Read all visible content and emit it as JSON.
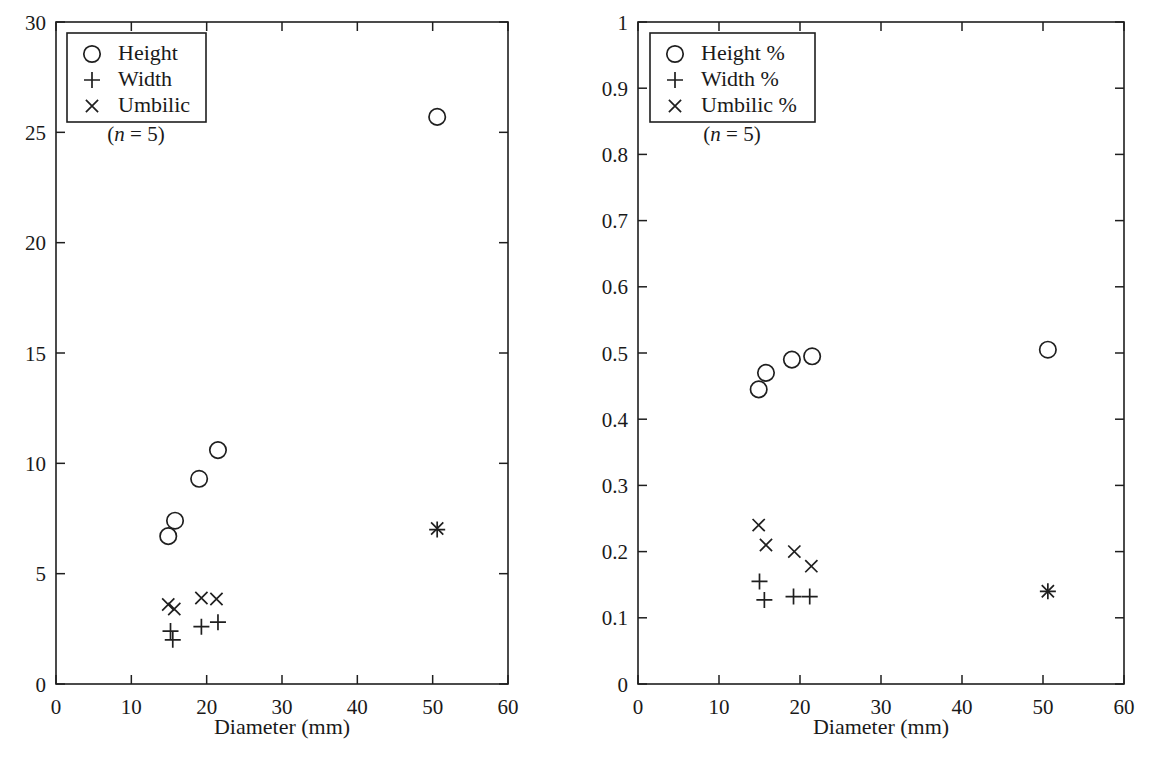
{
  "figure": {
    "background": "#ffffff",
    "ink_color": "#1f1f1f",
    "marker_symbols": {
      "circle": "o",
      "plus": "+",
      "cross": "x"
    },
    "bottom_cut_text": ""
  },
  "chart_data": [
    {
      "type": "scatter",
      "panel": "left",
      "title": "",
      "xlabel": "Diameter (mm)",
      "ylabel": "",
      "xlim": [
        0,
        60
      ],
      "ylim": [
        0,
        30
      ],
      "xticks": [
        0,
        10,
        20,
        30,
        40,
        50,
        60
      ],
      "xticklabels": [
        "0",
        "10",
        "20",
        "30",
        "40",
        "50",
        "60"
      ],
      "yticks": [
        0,
        5,
        10,
        15,
        20,
        25,
        30
      ],
      "yticklabels": [
        "0",
        "5",
        "10",
        "15",
        "20",
        "25",
        "30"
      ],
      "grid": false,
      "legend_position": "upper left",
      "annotation": "(n = 5)",
      "annotation_n_label": "n",
      "annotation_n_value": "5",
      "series": [
        {
          "name": "Height",
          "marker": "circle",
          "x": [
            14.9,
            15.8,
            19.0,
            21.5,
            50.6
          ],
          "y": [
            6.7,
            7.4,
            9.3,
            10.6,
            25.7
          ]
        },
        {
          "name": "Width",
          "marker": "plus",
          "x": [
            15.2,
            15.5,
            19.3,
            21.5,
            50.6
          ],
          "y": [
            2.4,
            2.0,
            2.6,
            2.8,
            7.0
          ]
        },
        {
          "name": "Umbilic",
          "marker": "cross",
          "x": [
            14.9,
            15.7,
            19.3,
            21.3,
            50.6
          ],
          "y": [
            3.6,
            3.4,
            3.9,
            3.85,
            7.05
          ]
        }
      ]
    },
    {
      "type": "scatter",
      "panel": "right",
      "title": "",
      "xlabel": "Diameter (mm)",
      "ylabel": "",
      "xlim": [
        0,
        60
      ],
      "ylim": [
        0,
        1
      ],
      "xticks": [
        0,
        10,
        20,
        30,
        40,
        50,
        60
      ],
      "xticklabels": [
        "0",
        "10",
        "20",
        "30",
        "40",
        "50",
        "60"
      ],
      "yticks": [
        0,
        0.1,
        0.2,
        0.3,
        0.4,
        0.5,
        0.6,
        0.7,
        0.8,
        0.9,
        1
      ],
      "yticklabels": [
        "0",
        "0.1",
        "0.2",
        "0.3",
        "0.4",
        "0.5",
        "0.6",
        "0.7",
        "0.8",
        "0.9",
        "1"
      ],
      "grid": false,
      "legend_position": "upper left",
      "annotation": "(n = 5)",
      "annotation_n_label": "n",
      "annotation_n_value": "5",
      "series": [
        {
          "name": "Height %",
          "marker": "circle",
          "x": [
            14.9,
            15.8,
            19.0,
            21.5,
            50.6
          ],
          "y": [
            0.445,
            0.47,
            0.49,
            0.495,
            0.505
          ]
        },
        {
          "name": "Width %",
          "marker": "plus",
          "x": [
            15.0,
            15.6,
            19.2,
            21.2,
            50.6
          ],
          "y": [
            0.155,
            0.127,
            0.132,
            0.132,
            0.14
          ]
        },
        {
          "name": "Umbilic %",
          "marker": "cross",
          "x": [
            14.9,
            15.8,
            19.3,
            21.4,
            50.6
          ],
          "y": [
            0.24,
            0.21,
            0.2,
            0.178,
            0.14
          ]
        }
      ]
    }
  ]
}
